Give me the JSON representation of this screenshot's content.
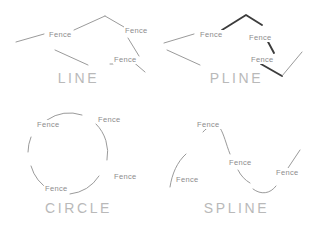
{
  "document": {
    "title": "Fence selection object types",
    "background_color": "#ffffff",
    "geometry_color": "#8f8f8f",
    "geometry_color_bold": "#3c3c3c",
    "caption_color": "#b9b9b9",
    "label_color": "#8d8d8d",
    "fence_label_text": "Fence"
  },
  "panels": [
    {
      "id": "line",
      "caption": "LINE",
      "object_type": "line",
      "stroke_weight": "thin",
      "labels": [
        {
          "text": "Fence",
          "x": 48,
          "y": 33
        },
        {
          "text": "Fence",
          "x": 124,
          "y": 29
        },
        {
          "text": "Fence",
          "x": 113,
          "y": 57
        }
      ]
    },
    {
      "id": "pline",
      "caption": "PLINE",
      "object_type": "polyline",
      "stroke_weight": "thick",
      "labels": [
        {
          "text": "Fence",
          "x": 199,
          "y": 33
        },
        {
          "text": "Fence",
          "x": 248,
          "y": 36
        },
        {
          "text": "Fence",
          "x": 250,
          "y": 58
        }
      ]
    },
    {
      "id": "circle",
      "caption": "CIRCLE",
      "object_type": "circle",
      "stroke_weight": "thin",
      "labels": [
        {
          "text": "Fence",
          "x": 36,
          "y": 122
        },
        {
          "text": "Fence",
          "x": 97,
          "y": 117
        },
        {
          "text": "Fence",
          "x": 113,
          "y": 174
        },
        {
          "text": "Fence",
          "x": 44,
          "y": 186
        }
      ]
    },
    {
      "id": "spline",
      "caption": "SPLINE",
      "object_type": "spline",
      "stroke_weight": "thin",
      "labels": [
        {
          "text": "Fence",
          "x": 196,
          "y": 122
        },
        {
          "text": "Fence",
          "x": 228,
          "y": 160
        },
        {
          "text": "Fence",
          "x": 275,
          "y": 170
        },
        {
          "text": "Fence",
          "x": 175,
          "y": 177
        }
      ]
    }
  ]
}
